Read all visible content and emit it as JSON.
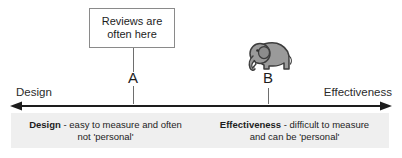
{
  "callout": {
    "lines": [
      "Reviews are",
      "often here"
    ]
  },
  "points": [
    {
      "id": "a",
      "label": "A"
    },
    {
      "id": "b",
      "label": "B"
    }
  ],
  "axis": {
    "left_label": "Design",
    "right_label": "Effectiveness",
    "line_color": "#1d1d1d"
  },
  "illustration": {
    "name": "elephant-icon",
    "body_color": "#9a9a9a",
    "outline_color": "#3d3d3d"
  },
  "band": {
    "background_color": "#efefef",
    "columns": [
      {
        "term": "Design",
        "line1_rest": " - easy to measure and often",
        "line2": "not 'personal'"
      },
      {
        "term": "Effectiveness",
        "line1_rest": " - difficult to measure",
        "line2": "and can be 'personal'"
      }
    ]
  }
}
